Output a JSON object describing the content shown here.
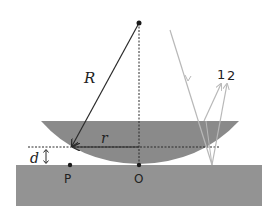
{
  "diagram": {
    "labels": {
      "radius": "R",
      "ring_radius": "r",
      "gap": "d",
      "point_p": "P",
      "point_o": "O",
      "ray_1": "1",
      "ray_2": "2"
    },
    "colors": {
      "lens": "#8a8a8a",
      "plate": "#939393",
      "lines": "#2a2a2a",
      "rays": "#b8b8b8",
      "background": "#ffffff"
    },
    "elements": [
      "center-of-curvature point",
      "radius line R with arrow",
      "vertical dashed axis",
      "plano-convex lens",
      "flat glass plate",
      "horizontal dashed level line",
      "radius r arrow",
      "gap d double arrow",
      "point P",
      "point O",
      "incident light ray",
      "reflected rays 1 and 2"
    ]
  }
}
